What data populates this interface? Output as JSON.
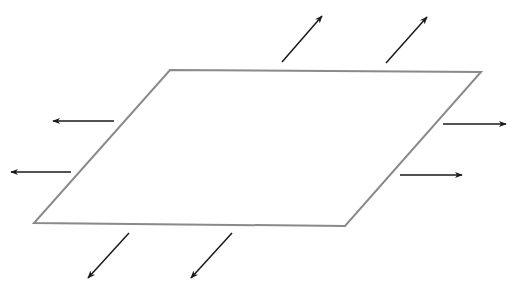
{
  "diagram": {
    "colors": {
      "sheet_outline": "#8a8a8a",
      "arrow": "#1a1a1a",
      "background": "#ffffff"
    },
    "sheet": {
      "points": [
        [
          170,
          70
        ],
        [
          481,
          72
        ],
        [
          345,
          226
        ],
        [
          34,
          223
        ]
      ]
    },
    "arrows": [
      {
        "id": "up-right-1",
        "from": [
          282,
          62
        ],
        "to": [
          322,
          16
        ]
      },
      {
        "id": "up-right-2",
        "from": [
          386,
          63
        ],
        "to": [
          427,
          17
        ]
      },
      {
        "id": "right-1",
        "from": [
          443,
          124
        ],
        "to": [
          506,
          124
        ]
      },
      {
        "id": "right-2",
        "from": [
          400,
          175
        ],
        "to": [
          462,
          175
        ]
      },
      {
        "id": "left-1",
        "from": [
          114,
          121
        ],
        "to": [
          53,
          121
        ]
      },
      {
        "id": "left-2",
        "from": [
          71,
          172
        ],
        "to": [
          11,
          172
        ]
      },
      {
        "id": "down-left-1",
        "from": [
          129,
          233
        ],
        "to": [
          88,
          278
        ]
      },
      {
        "id": "down-left-2",
        "from": [
          232,
          233
        ],
        "to": [
          191,
          278
        ]
      }
    ]
  }
}
